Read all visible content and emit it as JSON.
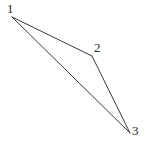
{
  "diagram": {
    "type": "triangle-vertex-diagram",
    "background_color": "#ffffff",
    "stroke_color": "#3a3a3a",
    "stroke_width": 1,
    "label_color": "#2b2b2b",
    "canvas": {
      "width": 146,
      "height": 145
    },
    "vertices": [
      {
        "id": "1",
        "label": "1",
        "x": 12,
        "y": 17,
        "label_x": 7,
        "label_y": 2
      },
      {
        "id": "2",
        "label": "2",
        "x": 92,
        "y": 56,
        "label_x": 94,
        "label_y": 41
      },
      {
        "id": "3",
        "label": "3",
        "x": 130,
        "y": 133,
        "label_x": 132,
        "label_y": 124
      }
    ],
    "edges": [
      {
        "id": "edge-1-2",
        "from": "1",
        "to": "2"
      },
      {
        "id": "edge-2-3",
        "from": "2",
        "to": "3"
      },
      {
        "id": "edge-1-3",
        "from": "1",
        "to": "3"
      }
    ]
  },
  "chart_data": {
    "type": "scatter",
    "title": "",
    "xlabel": "",
    "ylabel": "",
    "categories": [
      "1",
      "2",
      "3"
    ],
    "points": [
      {
        "label": "1",
        "x": 12,
        "y": 17
      },
      {
        "label": "2",
        "x": 92,
        "y": 56
      },
      {
        "label": "3",
        "x": 130,
        "y": 133
      }
    ],
    "connections": [
      [
        "1",
        "2"
      ],
      [
        "2",
        "3"
      ],
      [
        "1",
        "3"
      ]
    ],
    "xlim": [
      0,
      146
    ],
    "ylim": [
      0,
      145
    ],
    "grid": false,
    "legend": false
  }
}
